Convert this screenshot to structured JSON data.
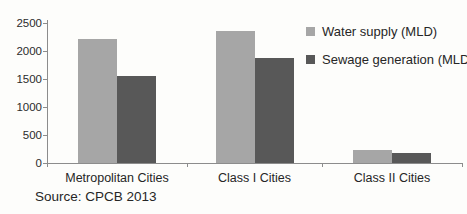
{
  "chart_data": {
    "type": "bar",
    "categories": [
      "Metropolitan Cities",
      "Class I Cities",
      "Class II Cities"
    ],
    "series": [
      {
        "name": "Water supply (MLD)",
        "color": "#a6a6a6",
        "values": [
          2220,
          2360,
          230
        ]
      },
      {
        "name": "Sewage generation (MLD)",
        "color": "#585858",
        "values": [
          1560,
          1880,
          180
        ]
      }
    ],
    "title": "",
    "xlabel": "",
    "ylabel": "",
    "ylim": [
      0,
      2500
    ],
    "ytick_step": 500,
    "ytick_labels": [
      "0",
      "500",
      "1000",
      "1500",
      "2000",
      "2500"
    ],
    "grid": false,
    "legend_position": "top-right"
  },
  "source_note": "Source: CPCB 2013",
  "colors": {
    "background": "#fdfdfb",
    "axis": "#8c8c8c",
    "text": "#262626",
    "bar_water_supply": "#a6a6a6",
    "bar_sewage_generation": "#585858"
  }
}
